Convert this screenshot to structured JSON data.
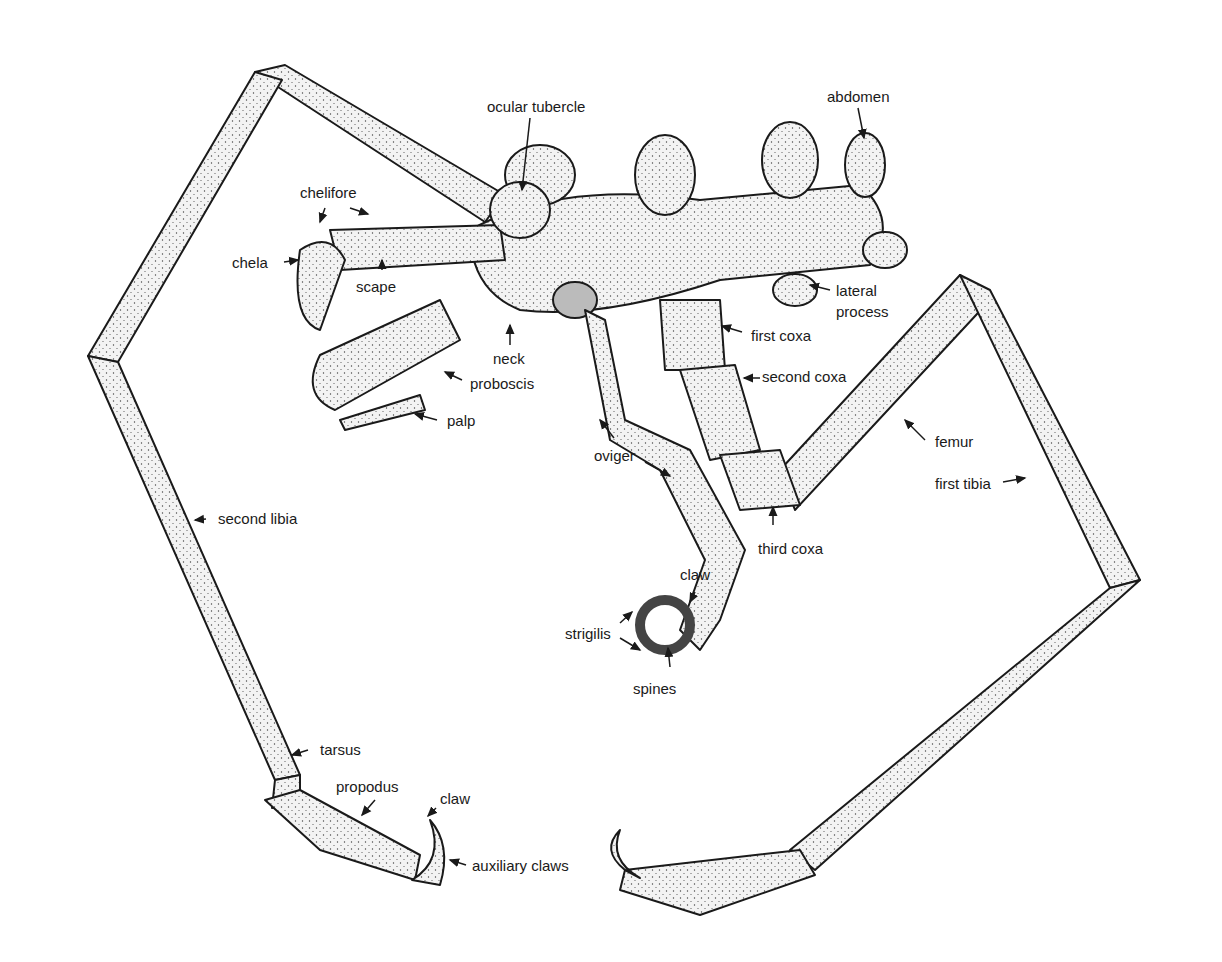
{
  "diagram": {
    "labels": {
      "ocular_tubercle": "ocular tubercle",
      "abdomen": "abdomen",
      "chelifore": "chelifore",
      "chela": "chela",
      "scape": "scape",
      "lateral_process_1": "lateral",
      "lateral_process_2": "process",
      "first_coxa": "first coxa",
      "neck": "neck",
      "second_coxa": "second coxa",
      "proboscis": "proboscis",
      "palp": "palp",
      "oviger": "oviger",
      "femur": "femur",
      "first_tibia": "first tibia",
      "second_libia": "second libia",
      "third_coxa": "third coxa",
      "claw_oviger": "claw",
      "strigilis": "strigilis",
      "spines": "spines",
      "tarsus": "tarsus",
      "propodus": "propodus",
      "claw_leg": "claw",
      "auxiliary_claws": "auxiliary claws"
    },
    "colors": {
      "ink": "#1a1a1a",
      "fill": "#f4f4f4",
      "background": "#ffffff"
    }
  }
}
